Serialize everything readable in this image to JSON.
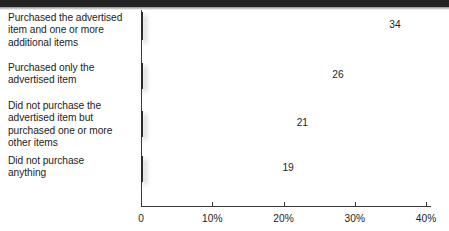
{
  "chart_data": {
    "type": "bar",
    "orientation": "horizontal",
    "title": "",
    "subtitle": "",
    "xlabel": "",
    "ylabel": "",
    "categories": [
      "Purchased the advertised item and one or more additional items",
      "Purchased only the advertised item",
      "Did not purchase the advertised item but purchased one or more other items",
      "Did not purchase anything"
    ],
    "values": [
      34,
      26,
      21,
      19
    ],
    "value_labels": [
      "34",
      "26",
      "21",
      "19"
    ],
    "xlim": [
      0,
      40
    ],
    "xticks": [
      0,
      10,
      20,
      30,
      40
    ],
    "xtick_labels": [
      "0",
      "10%",
      "20%",
      "30%",
      "40%"
    ],
    "grid": false,
    "legend": false,
    "legend_position": "none",
    "bar_colors": [
      "#272727",
      "#5d5d5d",
      "#8d8d8d",
      "#b3b3b3"
    ],
    "bar_border_color": "#2b2b2b",
    "axis_color": "#3a3a3a",
    "text_color": "#1d1d1d",
    "background": "#ffffff",
    "top_band_color": "#232323"
  },
  "labels": {
    "cat0_line1": "Purchased the advertised",
    "cat0_line2": "item and one or more",
    "cat0_line3": "additional items",
    "cat1_line1": "Purchased only the",
    "cat1_line2": "advertised item",
    "cat2_line1": "Did not purchase the",
    "cat2_line2": "advertised item but",
    "cat2_line3": "purchased one or more",
    "cat2_line4": "other items",
    "cat3_line1": "Did not purchase",
    "cat3_line2": "anything"
  }
}
